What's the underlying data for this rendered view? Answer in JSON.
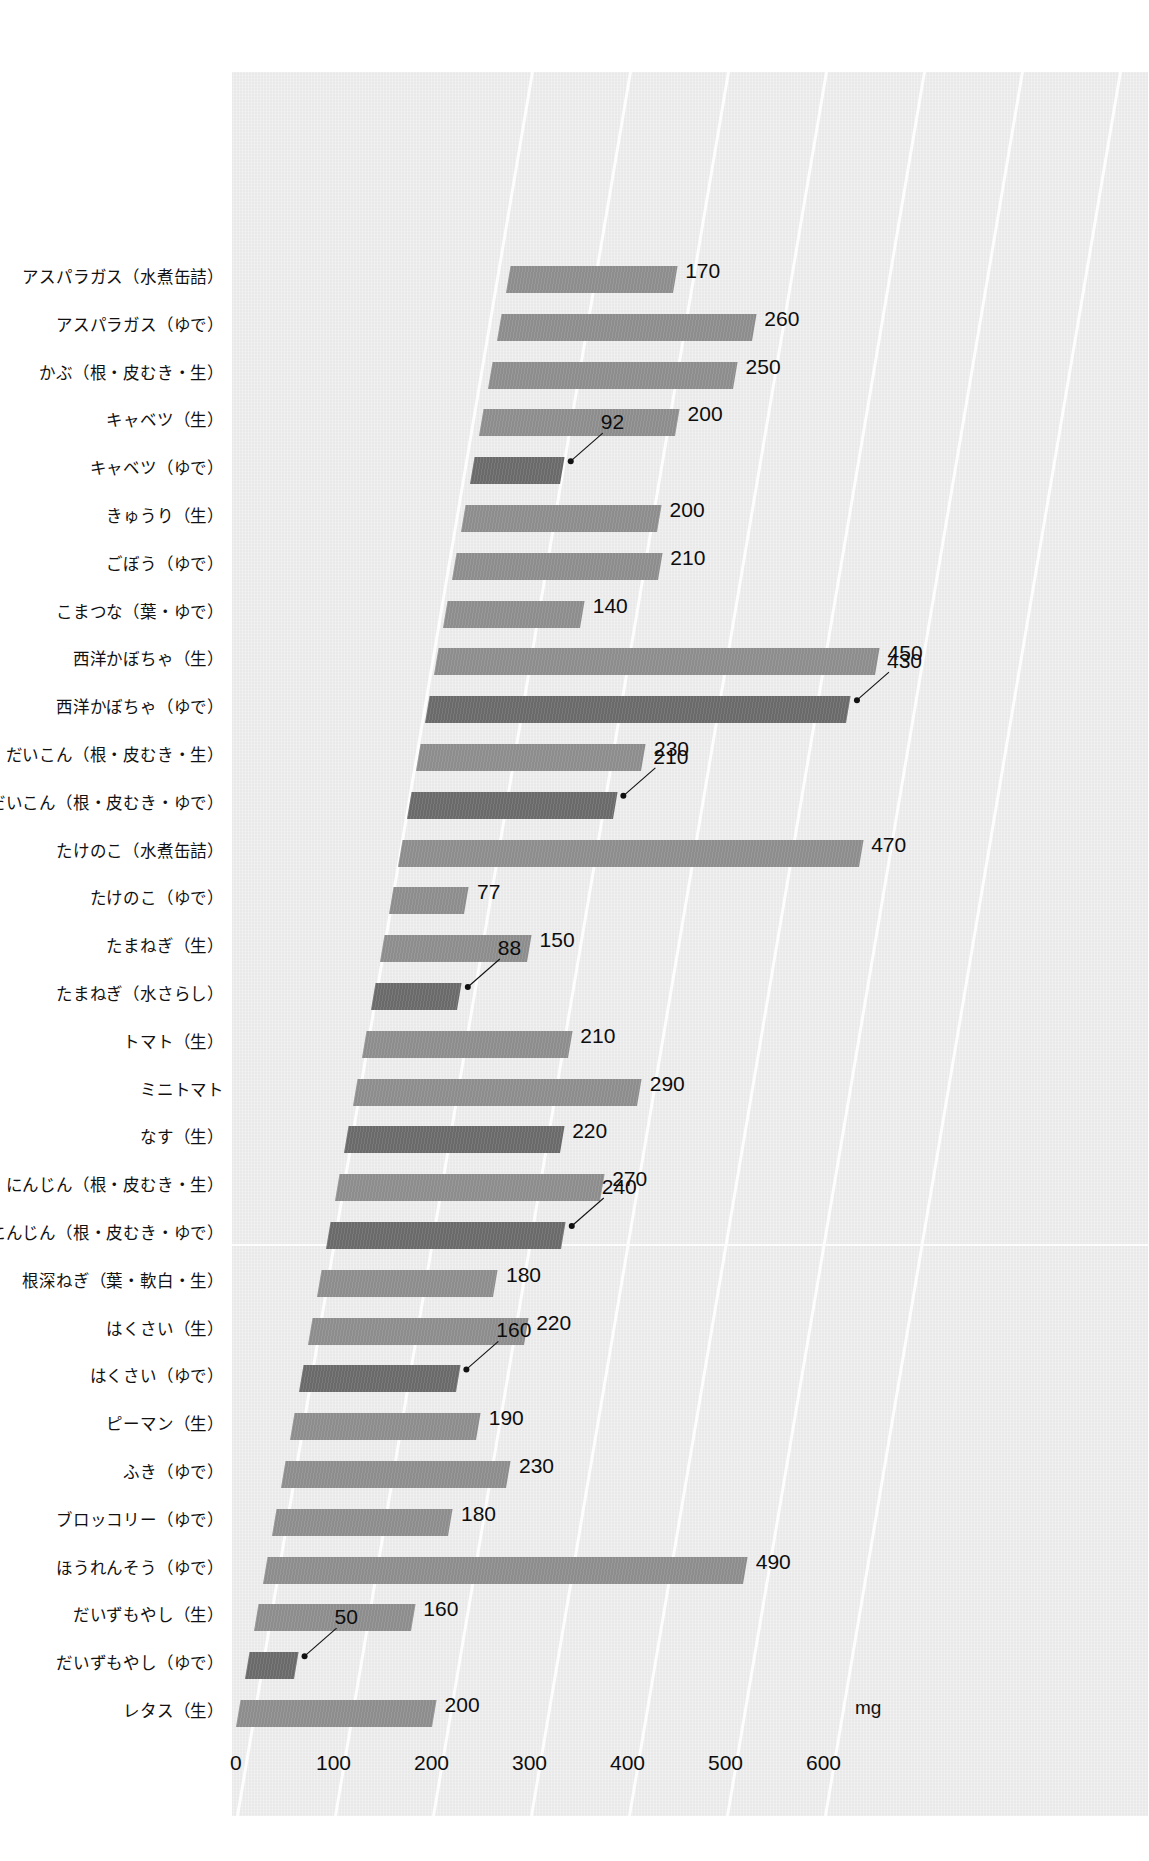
{
  "chart_data": {
    "type": "bar",
    "orientation": "horizontal",
    "title": "",
    "xlabel": "mg",
    "ylabel": "",
    "unit": "mg",
    "xlim": [
      0,
      640
    ],
    "xticks": [
      "0",
      "100",
      "200",
      "300",
      "400",
      "500",
      "600"
    ],
    "xtick_values": [
      0,
      100,
      200,
      300,
      400,
      500,
      600
    ],
    "grid": "vertical",
    "legend": "none",
    "categories": [
      "アスパラガス（水煮缶詰）",
      "アスパラガス（ゆで）",
      "かぶ（根・皮むき・生）",
      "キャベツ（生）",
      "キャベツ（ゆで）",
      "きゅうり（生）",
      "ごぼう（ゆで）",
      "こまつな（葉・ゆで）",
      "西洋かぼちゃ（生）",
      "西洋かぼちゃ（ゆで）",
      "だいこん（根・皮むき・生）",
      "だいこん（根・皮むき・ゆで）",
      "たけのこ（水煮缶詰）",
      "たけのこ（ゆで）",
      "たまねぎ（生）",
      "たまねぎ（水さらし）",
      "トマト（生）",
      "ミニトマト",
      "なす（生）",
      "にんじん（根・皮むき・生）",
      "にんじん（根・皮むき・ゆで）",
      "根深ねぎ（葉・軟白・生）",
      "はくさい（生）",
      "はくさい（ゆで）",
      "ピーマン（生）",
      "ふき（ゆで）",
      "ブロッコリー（ゆで）",
      "ほうれんそう（ゆで）",
      "だいずもやし（生）",
      "だいずもやし（ゆで）",
      "レタス（生）"
    ],
    "values": [
      170,
      260,
      250,
      200,
      92,
      200,
      210,
      140,
      450,
      430,
      230,
      210,
      470,
      77,
      150,
      88,
      210,
      290,
      220,
      270,
      240,
      180,
      220,
      160,
      190,
      230,
      180,
      490,
      160,
      50,
      200
    ],
    "value_labels": [
      "170",
      "260",
      "250",
      "200",
      "92",
      "200",
      "210",
      "140",
      "450",
      "430",
      "230",
      "210",
      "470",
      "77",
      "150",
      "88",
      "210",
      "290",
      "220",
      "270",
      "240",
      "180",
      "220",
      "160",
      "190",
      "230",
      "180",
      "490",
      "160",
      "50",
      "200"
    ],
    "bar_shades": [
      "light",
      "light",
      "light",
      "light",
      "dark",
      "light",
      "light",
      "light",
      "light",
      "dark",
      "light",
      "dark",
      "light",
      "light",
      "light",
      "dark",
      "light",
      "light",
      "dark",
      "light",
      "dark",
      "light",
      "light",
      "dark",
      "light",
      "light",
      "light",
      "light",
      "light",
      "dark",
      "light"
    ],
    "colors": {
      "bar_light": "#8d8d8d",
      "bar_dark": "#6a6a6a",
      "panel": "#e9e9e9",
      "gridline": "#fdfdfd",
      "text": "#111111"
    }
  }
}
